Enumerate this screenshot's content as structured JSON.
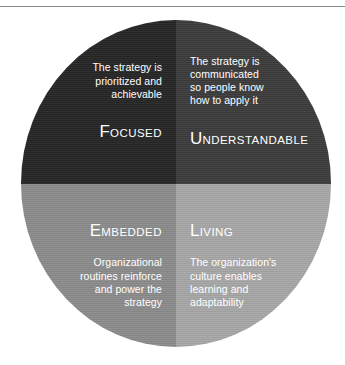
{
  "header": {
    "cropped_text": "",
    "rule_color": "#8a8a8a"
  },
  "figure": {
    "shape": "circle-four-quadrants",
    "quadrants": [
      {
        "position": "top-left",
        "label_initial": "F",
        "label_rest": "OCUSED",
        "label_full": "Focused",
        "description": "The strategy is\nprioritized and\nachievable",
        "fill": "#262626",
        "text_color": "#ffffff",
        "order": "description-then-label"
      },
      {
        "position": "top-right",
        "label_initial": "U",
        "label_rest": "NDERSTANDABLE",
        "label_full": "Understandable",
        "description": "The strategy is\ncommunicated\nso  people know\nhow to apply it",
        "fill": "#3c3c3c",
        "text_color": "#ffffff",
        "order": "description-then-label"
      },
      {
        "position": "bottom-left",
        "label_initial": "E",
        "label_rest": "MBEDDED",
        "label_full": "Embedded",
        "description": "Organizational\nroutines reinforce\nand power the\nstrategy",
        "fill": "#8c8c8c",
        "text_color": "#ffffff",
        "order": "label-then-description"
      },
      {
        "position": "bottom-right",
        "label_initial": "L",
        "label_rest": "IVING",
        "label_full": "Living",
        "description": "The organization's\nculture enables\nlearning and\nadaptability",
        "fill": "#a8a8a8",
        "text_color": "#ffffff",
        "order": "label-then-description"
      }
    ]
  }
}
